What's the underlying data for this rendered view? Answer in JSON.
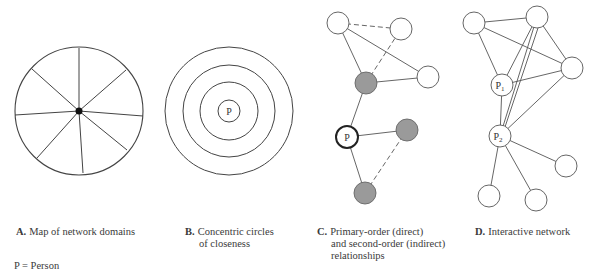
{
  "panels": [
    {
      "letter": "A.",
      "lines": [
        "Map of network domains"
      ]
    },
    {
      "letter": "B.",
      "lines": [
        "Concentric circles",
        "of closeness"
      ]
    },
    {
      "letter": "C.",
      "lines": [
        "Primary-order (direct)",
        "and second-order (indirect)",
        "relationships"
      ]
    },
    {
      "letter": "D.",
      "lines": [
        "Interactive network"
      ]
    }
  ],
  "node_labels": {
    "b_center": "P",
    "c_person": "P",
    "d_p1": "P",
    "d_p1_sub": "1",
    "d_p2": "P",
    "d_p2_sub": "2"
  },
  "legend": "P = Person",
  "colors": {
    "stroke": "#444444",
    "gray_node": "#9a9a9a",
    "white_node": "#ffffff"
  }
}
